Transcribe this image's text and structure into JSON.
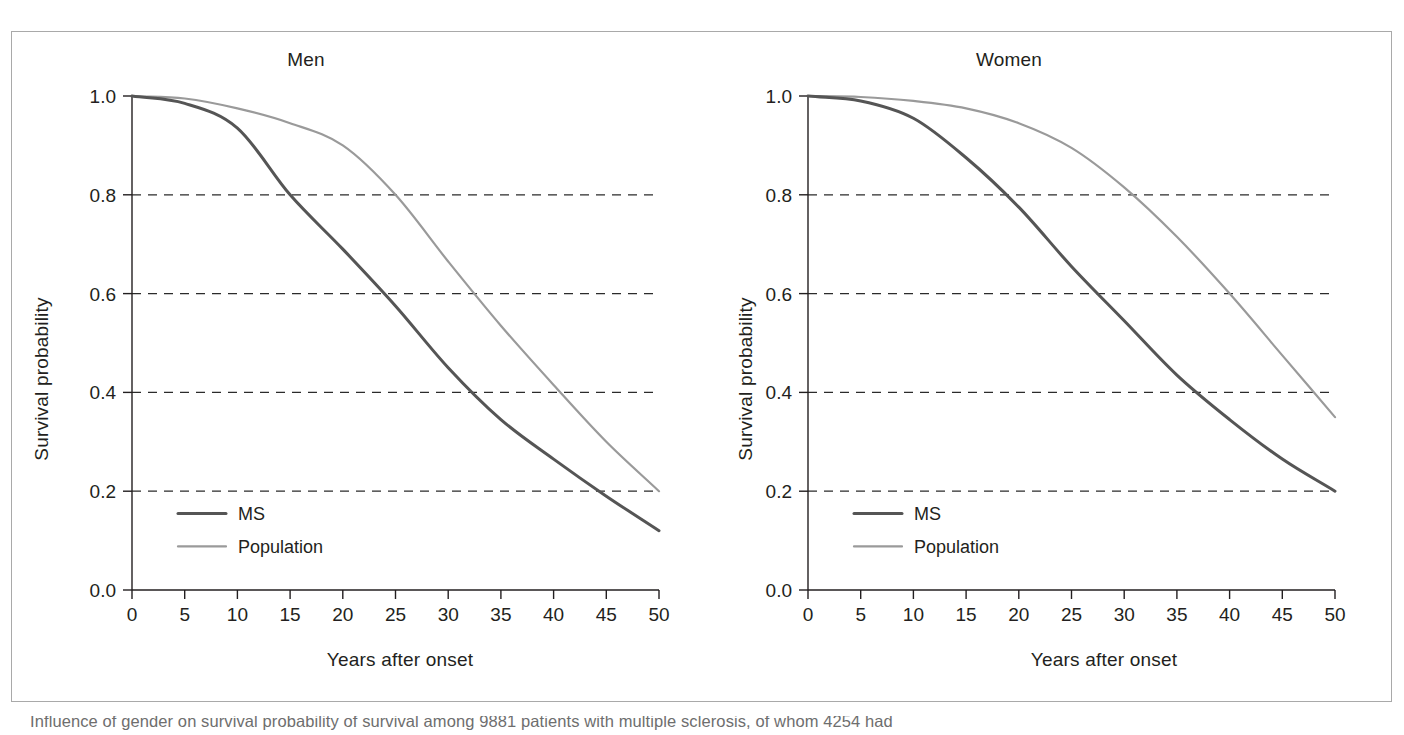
{
  "figure": {
    "caption_prefix": "Figure 4.17",
    "caption_text": "Influence of gender on survival probability of survival among 9881 patients with multiple sclerosis, of whom 4254 had"
  },
  "axes": {
    "ylabel": "Survival probability",
    "xlabel": "Years after onset",
    "yticks": [
      "0.0",
      "0.2",
      "0.4",
      "0.6",
      "0.8",
      "1.0"
    ],
    "ytick_values": [
      0.0,
      0.2,
      0.4,
      0.6,
      0.8,
      1.0
    ],
    "xticks": [
      "0",
      "5",
      "10",
      "15",
      "20",
      "25",
      "30",
      "35",
      "40",
      "45",
      "50"
    ],
    "xtick_values": [
      0,
      5,
      10,
      15,
      20,
      25,
      30,
      35,
      40,
      45,
      50
    ],
    "gridlines_at": [
      0.2,
      0.4,
      0.6,
      0.8
    ]
  },
  "legend": {
    "ms_label": "MS",
    "population_label": "Population"
  },
  "colors": {
    "ms": "#555555",
    "population": "#9a9a9a",
    "axis": "#231f20",
    "grid": "#2b2b2b",
    "frame": "#a9a9a9",
    "caption": "#6e6e6e"
  },
  "chart_data": [
    {
      "type": "line",
      "title": "Men",
      "xlabel": "Years after onset",
      "ylabel": "Survival probability",
      "xlim": [
        0,
        50
      ],
      "ylim": [
        0.0,
        1.0
      ],
      "grid": true,
      "legend_position": "lower-left",
      "x": [
        0,
        5,
        10,
        15,
        20,
        25,
        30,
        35,
        40,
        45,
        50
      ],
      "series": [
        {
          "name": "MS",
          "color": "#555555",
          "values": [
            1.0,
            0.985,
            0.935,
            0.8,
            0.69,
            0.575,
            0.45,
            0.345,
            0.265,
            0.19,
            0.12
          ]
        },
        {
          "name": "Population",
          "color": "#9a9a9a",
          "values": [
            1.0,
            0.995,
            0.975,
            0.945,
            0.9,
            0.8,
            0.665,
            0.535,
            0.415,
            0.3,
            0.2
          ]
        }
      ],
      "annotations": [
        "MS crosses 0.80 at ~15 years, 0.60 at ~24 years, 0.40 at ~32 years",
        "Population crosses 0.80 at ~25 years, 0.60 at ~33 years, 0.40 at ~41 years"
      ]
    },
    {
      "type": "line",
      "title": "Women",
      "xlabel": "Years after onset",
      "ylabel": "Survival probability",
      "xlim": [
        0,
        50
      ],
      "ylim": [
        0.0,
        1.0
      ],
      "grid": true,
      "legend_position": "lower-left",
      "x": [
        0,
        5,
        10,
        15,
        20,
        25,
        30,
        35,
        40,
        45,
        50
      ],
      "series": [
        {
          "name": "MS",
          "color": "#555555",
          "values": [
            1.0,
            0.99,
            0.955,
            0.875,
            0.775,
            0.655,
            0.545,
            0.435,
            0.345,
            0.265,
            0.2
          ]
        },
        {
          "name": "Population",
          "color": "#9a9a9a",
          "values": [
            1.0,
            0.998,
            0.99,
            0.975,
            0.945,
            0.895,
            0.815,
            0.715,
            0.6,
            0.475,
            0.35
          ]
        }
      ],
      "annotations": [
        "MS crosses 0.80 at ~18 years, 0.60 at ~28 years, 0.40 at ~37 years",
        "Population crosses 0.80 at ~31 years, 0.60 at ~40 years, 0.40 at ~48 years"
      ]
    }
  ]
}
